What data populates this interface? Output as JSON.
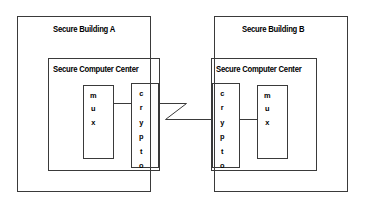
{
  "diagram": {
    "line_color": "#333333",
    "text_color": "#000000",
    "background": "#ffffff",
    "buildings": [
      {
        "id": "building-a",
        "label": "Secure Building A",
        "center_label": "Secure Computer Center",
        "boxes": [
          {
            "id": "mux-a",
            "label": "mux",
            "letters": [
              "m",
              "u",
              "x"
            ]
          },
          {
            "id": "crypto-a",
            "label": "crypto",
            "letters": [
              "c",
              "r",
              "y",
              "p",
              "t",
              "o"
            ]
          }
        ]
      },
      {
        "id": "building-b",
        "label": "Secure Building B",
        "center_label": "Secure Computer Center",
        "boxes": [
          {
            "id": "crypto-b",
            "label": "crypto",
            "letters": [
              "c",
              "r",
              "y",
              "p",
              "t",
              "o"
            ]
          },
          {
            "id": "mux-b",
            "label": "mux",
            "letters": [
              "m",
              "u",
              "x"
            ]
          }
        ]
      }
    ],
    "link": {
      "id": "unsecured-link",
      "shape": "zigzag",
      "label": ""
    }
  }
}
